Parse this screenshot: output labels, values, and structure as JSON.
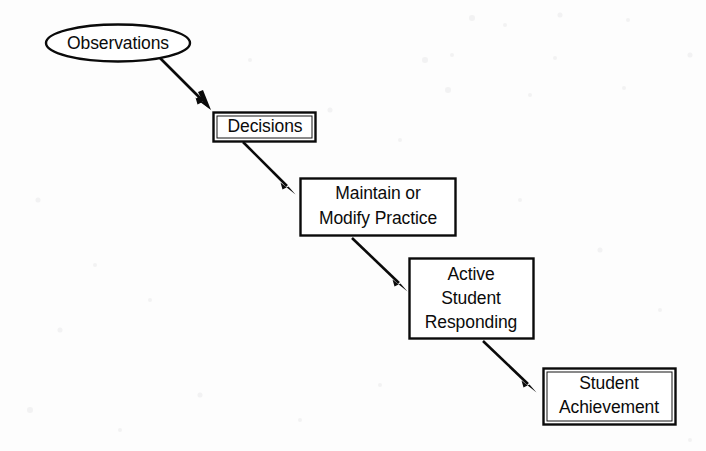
{
  "diagram": {
    "background_color": "#fdfdfd",
    "line_color": "#0a0a0a",
    "text_color": "#0b0b0b",
    "nodes": [
      {
        "id": "observations",
        "shape": "ellipse",
        "label": "Observations",
        "lines": [
          "Observations"
        ]
      },
      {
        "id": "decisions",
        "shape": "rect",
        "label": "Decisions",
        "lines": [
          "Decisions"
        ]
      },
      {
        "id": "maintain-or-modify-practice",
        "shape": "rect",
        "label": "Maintain or Modify Practice",
        "lines": [
          "Maintain or",
          "Modify Practice"
        ]
      },
      {
        "id": "active-student-responding",
        "shape": "rect",
        "label": "Active Student Responding",
        "lines": [
          "Active",
          "Student",
          "Responding"
        ]
      },
      {
        "id": "student-achievement",
        "shape": "rect",
        "label": "Student Achievement",
        "lines": [
          "Student",
          "Achievement"
        ]
      }
    ],
    "edges": [
      {
        "id": "edge-observations-decisions",
        "from": "observations",
        "to": "decisions",
        "style": "solid-arrow"
      },
      {
        "id": "edge-decisions-maintain",
        "from": "decisions",
        "to": "maintain-or-modify-practice",
        "style": "solid-arrow"
      },
      {
        "id": "edge-maintain-active",
        "from": "maintain-or-modify-practice",
        "to": "active-student-responding",
        "style": "solid-arrow"
      },
      {
        "id": "edge-active-achievement",
        "from": "active-student-responding",
        "to": "student-achievement",
        "style": "solid-arrow"
      }
    ]
  }
}
